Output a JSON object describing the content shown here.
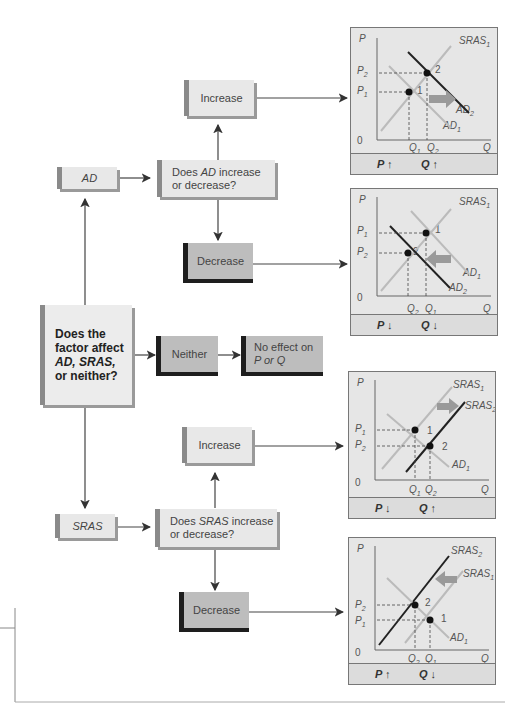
{
  "flowchart": {
    "main_question": {
      "line1": "Does the",
      "line2": "factor affect",
      "line3": "AD, SRAS,",
      "line4": "or neither?"
    },
    "ad_branch": {
      "label": "AD",
      "question_pre": "Does ",
      "question_var": "AD",
      "question_post": " increase",
      "question_line2": "or decrease?",
      "increase": "Increase",
      "decrease": "Decrease"
    },
    "neither_branch": {
      "label": "Neither",
      "result_line1": "No effect on",
      "result_line2": "P or Q"
    },
    "sras_branch": {
      "label": "SRAS",
      "question_pre": "Does ",
      "question_var": "SRAS",
      "question_post": " increase",
      "question_line2": "or decrease?",
      "increase": "Increase",
      "decrease": "Decrease"
    }
  },
  "charts": [
    {
      "id": "ad-increase",
      "footer_p": "P ↑",
      "footer_q": "Q ↑",
      "curves": [
        "SRAS1",
        "AD1",
        "AD2"
      ],
      "shift": "right",
      "points": [
        "1",
        "2"
      ],
      "prices": [
        "P2",
        "P1"
      ],
      "quantities": [
        "Q1",
        "Q2"
      ]
    },
    {
      "id": "ad-decrease",
      "footer_p": "P ↓",
      "footer_q": "Q ↓",
      "curves": [
        "SRAS1",
        "AD1",
        "AD2"
      ],
      "shift": "left",
      "points": [
        "1",
        "2"
      ],
      "prices": [
        "P1",
        "P2"
      ],
      "quantities": [
        "Q2",
        "Q1"
      ]
    },
    {
      "id": "sras-increase",
      "footer_p": "P ↓",
      "footer_q": "Q ↑",
      "curves": [
        "SRAS1",
        "SRAS2",
        "AD1"
      ],
      "shift": "right",
      "points": [
        "1",
        "2"
      ],
      "prices": [
        "P1",
        "P2"
      ],
      "quantities": [
        "Q1",
        "Q2"
      ]
    },
    {
      "id": "sras-decrease",
      "footer_p": "P ↑",
      "footer_q": "Q ↓",
      "curves": [
        "SRAS2",
        "SRAS1",
        "AD1"
      ],
      "shift": "left",
      "points": [
        "2",
        "1"
      ],
      "prices": [
        "P2",
        "P1"
      ],
      "quantities": [
        "Q2",
        "Q1"
      ]
    }
  ],
  "axis": {
    "price": "P",
    "quantity": "Q",
    "origin": "0"
  },
  "colors": {
    "light_box": "#e8e8e8",
    "dark_box": "#bdbdbd",
    "chart_bg": "#e6e6e6",
    "old_curve": "#b8b8b8",
    "new_curve": "#222222",
    "arrow": "#999999"
  }
}
